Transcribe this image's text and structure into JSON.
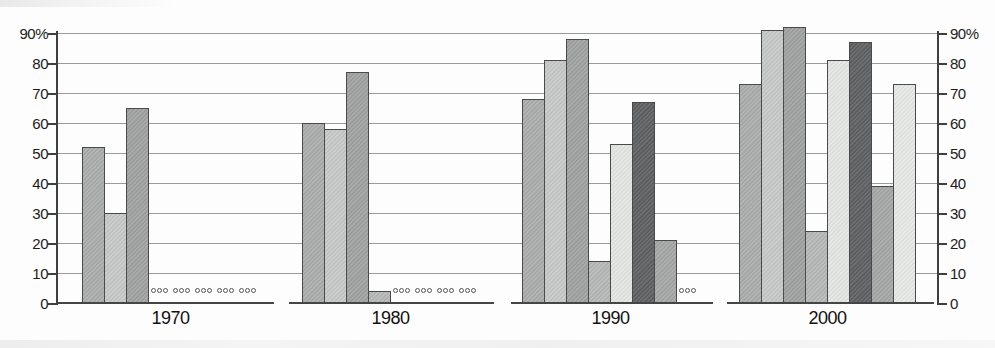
{
  "chart_data": {
    "type": "bar",
    "title": "",
    "xlabel": "",
    "ylabel": "",
    "unit": "%",
    "ylim": [
      0,
      90
    ],
    "yticks": [
      0,
      10,
      20,
      30,
      40,
      50,
      60,
      70,
      80,
      90
    ],
    "grid": true,
    "legend": false,
    "dual_axis": true,
    "missing_marker": "ooo",
    "categories": [
      "1970",
      "1980",
      "1990",
      "2000"
    ],
    "series_count": 8,
    "groups": [
      {
        "year": "1970",
        "values": [
          52,
          30,
          65,
          null,
          null,
          null,
          null,
          null
        ]
      },
      {
        "year": "1980",
        "values": [
          60,
          58,
          77,
          4,
          null,
          null,
          null,
          null
        ]
      },
      {
        "year": "1990",
        "values": [
          68,
          81,
          88,
          14,
          53,
          67,
          21,
          null
        ]
      },
      {
        "year": "2000",
        "values": [
          73,
          91,
          92,
          24,
          81,
          87,
          39,
          73
        ]
      }
    ],
    "series_colors": [
      "#aaacab",
      "#c6c8c7",
      "#9fa1a0",
      "#b5b7b6",
      "#e3e5e2",
      "#5d5f60",
      "#a4a6a5",
      "#e6e8e5"
    ],
    "axis": {
      "left_labels": [
        "90%",
        "80",
        "70",
        "60",
        "50",
        "40",
        "30",
        "20",
        "10",
        "0"
      ],
      "right_labels": [
        "90%",
        "80",
        "70",
        "60",
        "50",
        "40",
        "30",
        "20",
        "10",
        "0"
      ]
    }
  }
}
